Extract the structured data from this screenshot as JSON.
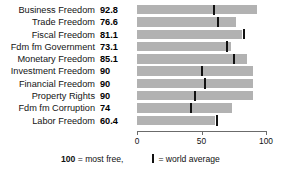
{
  "chart_data": {
    "type": "bar",
    "orientation": "horizontal",
    "title": "",
    "xlabel": "",
    "ylabel": "",
    "xlim": [
      0,
      100
    ],
    "grid": false,
    "categories": [
      "Business Freedom",
      "Trade Freedom",
      "Fiscal Freedom",
      "Fdm fm Government",
      "Monetary Freedom",
      "Investment Freedom",
      "Financial Freedom",
      "Property Rights",
      "Fdm fm Corruption",
      "Labor Freedom"
    ],
    "values": [
      92.8,
      76.6,
      81.1,
      73.1,
      85.1,
      90,
      90,
      90,
      74,
      60.4
    ],
    "value_labels": [
      "92.8",
      "76.6",
      "81.1",
      "73.1",
      "85.1",
      "90",
      "90",
      "90",
      "74",
      "60.4"
    ],
    "series": [
      {
        "name": "Score",
        "values": [
          92.8,
          76.6,
          81.1,
          73.1,
          85.1,
          90,
          90,
          90,
          74,
          60.4
        ]
      },
      {
        "name": "world average",
        "values": [
          60,
          63,
          83,
          70,
          75,
          50,
          53,
          45,
          42,
          62
        ]
      }
    ],
    "xticks": [
      0,
      50,
      100
    ],
    "xticklabels": [
      "0",
      "50",
      "100"
    ],
    "bar_color": "#b2b2b2",
    "marker_color": "#111111"
  },
  "legend": {
    "most_free_value": "100",
    "most_free_text": " = most free,",
    "world_average_text": " = world average"
  }
}
